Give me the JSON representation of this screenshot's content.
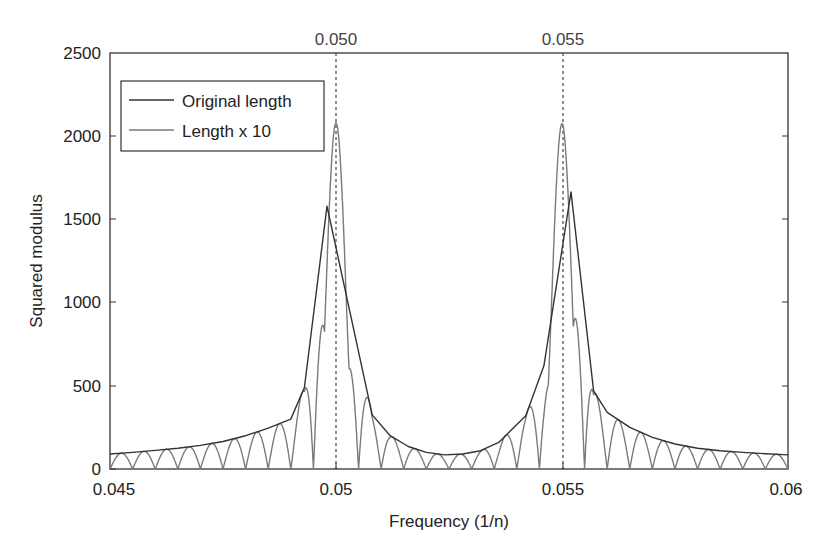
{
  "chart_data": {
    "type": "line",
    "title": "",
    "xlabel": "Frequency (1/n)",
    "ylabel": "Squared modulus",
    "xlim": [
      0.045,
      0.06
    ],
    "ylim": [
      0,
      2500
    ],
    "x_ticks": [
      0.045,
      0.05,
      0.055,
      0.06
    ],
    "x_tick_labels": [
      "0.045",
      "0.05",
      "0.055",
      "0.06"
    ],
    "y_ticks": [
      0,
      500,
      1000,
      1500,
      2000,
      2500
    ],
    "y_tick_labels": [
      "0",
      "500",
      "1000",
      "1500",
      "2000",
      "2500"
    ],
    "grid": false,
    "legend_position": "upper left",
    "reference_lines": [
      {
        "x": 0.05,
        "label": "0.050",
        "style": "dashed"
      },
      {
        "x": 0.055,
        "label": "0.055",
        "style": "dashed"
      }
    ],
    "series": [
      {
        "name": "Original length",
        "color": "#333333",
        "x": [
          0.045,
          0.0455,
          0.046,
          0.0465,
          0.047,
          0.0475,
          0.048,
          0.0485,
          0.049,
          0.0493,
          0.0498,
          0.0508,
          0.0512,
          0.0516,
          0.052,
          0.0524,
          0.0528,
          0.0532,
          0.0536,
          0.0539,
          0.0542,
          0.0546,
          0.0552,
          0.0557,
          0.056,
          0.0565,
          0.057,
          0.0575,
          0.058,
          0.0585,
          0.059,
          0.0595,
          0.06
        ],
        "y": [
          90,
          100,
          112,
          125,
          142,
          165,
          200,
          245,
          300,
          490,
          1580,
          325,
          200,
          135,
          100,
          85,
          90,
          110,
          160,
          240,
          320,
          620,
          1665,
          470,
          340,
          250,
          190,
          150,
          125,
          110,
          100,
          92,
          85
        ]
      },
      {
        "name": "Length x 10",
        "color": "#777777",
        "peaks": [
          {
            "x": 0.05,
            "y": 2080
          },
          {
            "x": 0.055,
            "y": 2075
          }
        ],
        "sidelobe_spacing": 0.0005,
        "note": "oscillating curve touching the Original-length envelope, with nulls near zero between lobes"
      }
    ]
  },
  "legend": {
    "items": [
      {
        "label": "Original length",
        "color": "#333333"
      },
      {
        "label": "Length x 10",
        "color": "#777777"
      }
    ]
  },
  "axes": {
    "xlabel": "Frequency (1/n)",
    "ylabel": "Squared modulus",
    "ref_label_1": "0.050",
    "ref_label_2": "0.055",
    "x_tick_0": "0.045",
    "x_tick_1": "0.05",
    "x_tick_2": "0.055",
    "x_tick_3": "0.06",
    "y_tick_0": "0",
    "y_tick_1": "500",
    "y_tick_2": "1000",
    "y_tick_3": "1500",
    "y_tick_4": "2000",
    "y_tick_5": "2500"
  }
}
